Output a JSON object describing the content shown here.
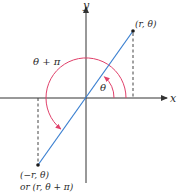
{
  "diagram": {
    "type": "polar-coordinates",
    "axes": {
      "x_label": "x",
      "y_label": "y"
    },
    "points": [
      {
        "id": "p1",
        "label": "(r, θ)",
        "x": 133,
        "y": 31
      },
      {
        "id": "p2",
        "label_line1": "(−r, θ)",
        "label_line2": "or (r, θ + π)",
        "x": 38,
        "y": 165
      }
    ],
    "angles": {
      "theta_label": "θ",
      "theta_plus_pi_label": "θ + π"
    },
    "colors": {
      "axis": "#333333",
      "ray": "#3a7fd0",
      "arc": "#e0406a",
      "dashed": "#444444",
      "point": "#1a1a1a"
    }
  }
}
